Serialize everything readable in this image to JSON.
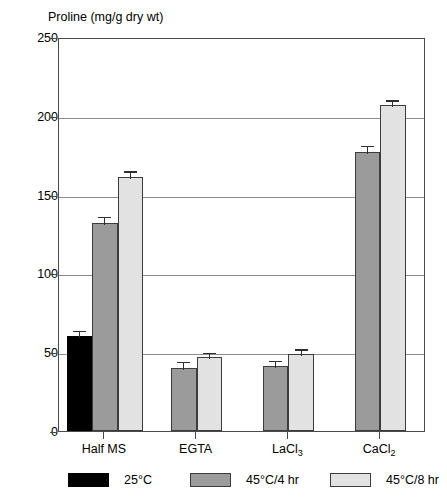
{
  "chart_data": {
    "type": "bar",
    "title": "Proline (mg/g dry wt)",
    "xlabel": "",
    "ylabel": "Proline (mg/g dry wt)",
    "ylim": [
      0,
      250
    ],
    "yticks": [
      0,
      50,
      100,
      150,
      200,
      250
    ],
    "ytick_labels": [
      "0",
      "50",
      "100",
      "150",
      "200",
      "250"
    ],
    "grid": "horizontal",
    "legend_position": "bottom",
    "categories": [
      "Half MS",
      "EGTA",
      "LaCl3",
      "CaCl2"
    ],
    "category_labels": [
      {
        "text": "Half MS",
        "sub": ""
      },
      {
        "text": "EGTA",
        "sub": ""
      },
      {
        "text": "LaCl",
        "sub": "3"
      },
      {
        "text": "CaCl",
        "sub": "2"
      }
    ],
    "series": [
      {
        "name": "25°C",
        "color": "#000000",
        "values": [
          60,
          null,
          null,
          null
        ],
        "errors": [
          5,
          null,
          null,
          null
        ]
      },
      {
        "name": "45°C/4 hr",
        "color": "#9b9b9b",
        "values": [
          132,
          40,
          41,
          177
        ],
        "errors": [
          5,
          5,
          5,
          5
        ]
      },
      {
        "name": "45°C/8 hr",
        "color": "#e2e2e2",
        "values": [
          161,
          47,
          49,
          207
        ],
        "errors": [
          5,
          4,
          4,
          4
        ]
      }
    ]
  },
  "legend": {
    "items": [
      {
        "label": "25°C",
        "swatch": "black-swatch"
      },
      {
        "label": "45°C/4 hr",
        "swatch": "medium-gray-swatch"
      },
      {
        "label": "45°C/8 hr",
        "swatch": "light-gray-swatch"
      }
    ]
  },
  "colors": {
    "series_25c": "#000000",
    "series_45c_4hr": "#9b9b9b",
    "series_45c_8hr": "#e2e2e2",
    "axis": "#4a4a4a",
    "gridline": "#8d8d8d",
    "background": "#ffffff"
  }
}
